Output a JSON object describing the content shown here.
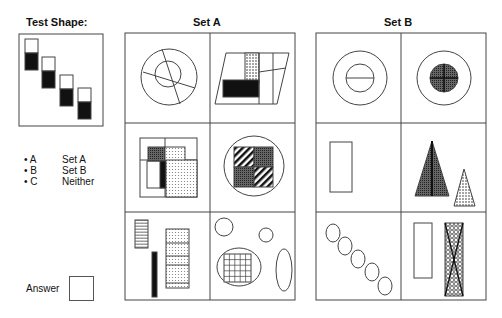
{
  "test_shape": {
    "title": "Test Shape:",
    "description": "Four rectangles arranged diagonally, each with bottom half black"
  },
  "options": [
    {
      "key": "A",
      "label": "Set A"
    },
    {
      "key": "B",
      "label": "Set B"
    },
    {
      "key": "C",
      "label": "Neither"
    }
  ],
  "answer": {
    "label": "Answer",
    "value": ""
  },
  "set_a": {
    "title": "Set A",
    "cells": [
      "Concentric circles cut by two lines",
      "Parallelogram with dotted and black rectangles",
      "Nested squares with dotted and black blocks",
      "Circle around square of hatched and dotted quadrants",
      "Hatched bar, black bar and segmented dotted column",
      "Circles, ellipse with grid square, tall ellipse"
    ]
  },
  "set_b": {
    "title": "Set B",
    "cells": [
      "Concentric circles with horizontal line",
      "Concentric circles with shaded crossed disc",
      "Single tall rectangle",
      "Two shaded triangles",
      "Five circles in a diagonal",
      "Empty rectangle and crosshatched rectangle with X"
    ]
  },
  "colors": {
    "line": "#444444",
    "fill_black": "#111111"
  }
}
